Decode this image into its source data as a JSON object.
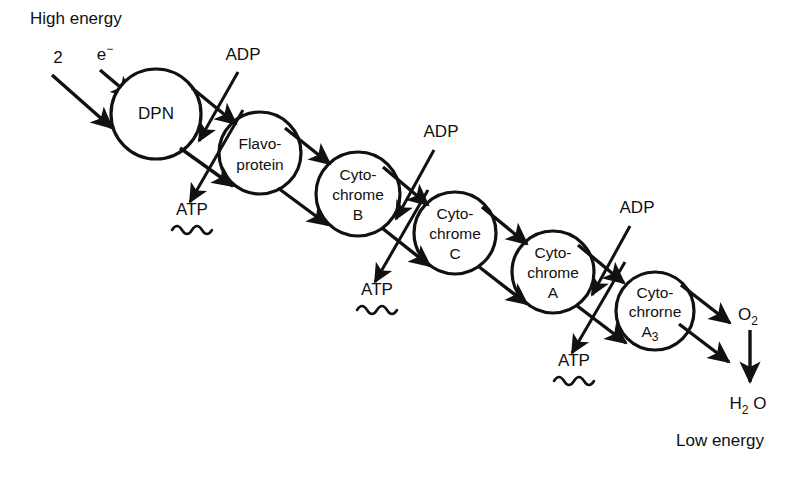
{
  "diagram": {
    "colors": {
      "ink": "#111111",
      "background": "#ffffff"
    },
    "input_labels": {
      "high_energy": "High energy",
      "electron_count": "2",
      "electron_symbol_base": "e",
      "electron_symbol_charge": "−"
    },
    "output_labels": {
      "low_energy": "Low energy",
      "oxygen_base": "O",
      "oxygen_sub": "2",
      "water_base_h": "H",
      "water_sub": "2",
      "water_base_o": "O"
    },
    "carriers": [
      {
        "id": "dpn",
        "lines": [
          "DPN"
        ],
        "cx": 156,
        "cy": 114,
        "r": 45
      },
      {
        "id": "flavoprotein",
        "lines": [
          "Flavo-",
          "protein"
        ],
        "cx": 260,
        "cy": 153,
        "r": 41
      },
      {
        "id": "cytochrome-b",
        "lines": [
          "Cyto-",
          "chrome",
          "B"
        ],
        "cx": 358,
        "cy": 194,
        "r": 42
      },
      {
        "id": "cytochrome-c",
        "lines": [
          "Cyto-",
          "chrome",
          "C"
        ],
        "cx": 455,
        "cy": 233,
        "r": 41
      },
      {
        "id": "cytochrome-a",
        "lines": [
          "Cyto-",
          "chrome",
          "A"
        ],
        "cx": 553,
        "cy": 272,
        "r": 41
      },
      {
        "id": "cytochrome-a3",
        "lines": [
          "Cyto-",
          "chrorne",
          "A"
        ],
        "sub": "3",
        "cx": 655,
        "cy": 311,
        "r": 39
      }
    ],
    "coupling_sites": [
      {
        "id": "site-1",
        "adp_label": "ADP",
        "adp_x": 243,
        "adp_y": 60,
        "atp_label": "ATP",
        "atp_x": 192,
        "atp_y": 215
      },
      {
        "id": "site-2",
        "adp_label": "ADP",
        "adp_x": 441,
        "adp_y": 137,
        "atp_label": "ATP",
        "atp_x": 377,
        "atp_y": 295
      },
      {
        "id": "site-3",
        "adp_label": "ADP",
        "adp_x": 637,
        "adp_y": 213,
        "atp_label": "ATP",
        "atp_x": 574,
        "atp_y": 366
      }
    ]
  }
}
